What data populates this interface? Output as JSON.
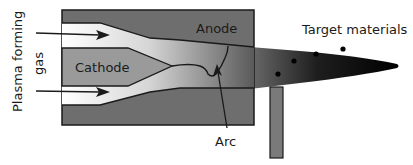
{
  "diagram": {
    "labels": {
      "gas_line1": "Plasma forming",
      "gas_line2": "gas",
      "cathode": "Cathode",
      "anode": "Anode",
      "arc": "Arc",
      "target": "Target materials"
    },
    "colors": {
      "anode": "#6e6e6e",
      "cathode": "#9a9a9a",
      "gas_light": "#f2f2f2",
      "plume_dark": "#000000",
      "probe": "#7a7a7a",
      "outline": "#1a1a1a"
    }
  }
}
